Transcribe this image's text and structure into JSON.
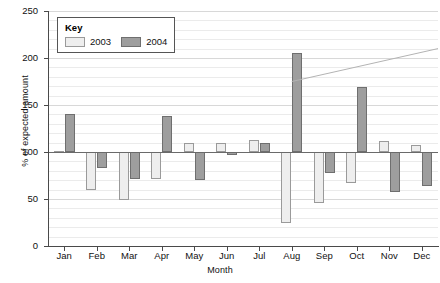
{
  "chart_data": {
    "type": "bar",
    "title": "",
    "xlabel": "Month",
    "ylabel": "% of expected amount",
    "categories": [
      "Jan",
      "Feb",
      "Mar",
      "Apr",
      "May",
      "Jun",
      "Jul",
      "Aug",
      "Sep",
      "Oct",
      "Nov",
      "Dec"
    ],
    "series": [
      {
        "name": "2003",
        "color": "#eeeeee",
        "values": [
          101,
          60,
          49,
          71,
          110,
          110,
          113,
          24,
          46,
          67,
          112,
          107
        ]
      },
      {
        "name": "2004",
        "color": "#9e9e9e",
        "values": [
          140,
          83,
          71,
          138,
          70,
          97,
          110,
          205,
          78,
          169,
          57,
          64
        ]
      }
    ],
    "baseline": 100,
    "ylim": [
      0,
      250
    ],
    "yticks": [
      0,
      50,
      100,
      150,
      200,
      250
    ],
    "ytick_labels": [
      "0",
      "50",
      "100",
      "150",
      "200",
      "250"
    ],
    "minor_gridline_step": 10,
    "grid": true,
    "annotations": [
      {
        "type": "line",
        "name": "trend-line",
        "x_start_month": "Aug",
        "y_start": 175,
        "x_end_month": "Dec",
        "y_end": 210,
        "color": "#b3b3b3"
      }
    ],
    "legend": {
      "position": "top-left-inside",
      "title": "Key",
      "entries": [
        "2003",
        "2004"
      ]
    }
  }
}
